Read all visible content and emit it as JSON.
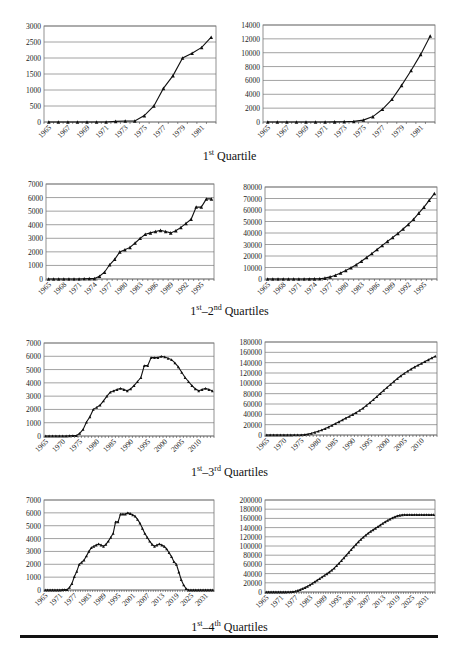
{
  "captions": [
    {
      "sup1": "st",
      "text": "1",
      "sep": "",
      "sup2": "",
      "num2": "",
      "label": " Quartile"
    },
    {
      "sup1": "st",
      "text": "1",
      "sep": "–",
      "num2": "2",
      "sup2": "nd",
      "label": " Quartiles"
    },
    {
      "sup1": "st",
      "text": "1",
      "sep": "–",
      "num2": "3",
      "sup2": "rd",
      "label": " Quartiles"
    },
    {
      "sup1": "st",
      "text": "1",
      "sep": "–",
      "num2": "4",
      "sup2": "th",
      "label": " Quartiles"
    }
  ],
  "chart_data": [
    {
      "id": "q1-annual",
      "type": "line",
      "title": "",
      "xlabel": "",
      "ylabel": "",
      "ylim": [
        0,
        3000
      ],
      "yticks": [
        0,
        500,
        1000,
        1500,
        2000,
        2500,
        3000
      ],
      "x_start": 1965,
      "x_end": 1982,
      "xtick_step": 2,
      "xticks": [
        "1965",
        "1967",
        "1969",
        "1971",
        "1973",
        "1975",
        "1977",
        "1979",
        "1981"
      ],
      "values": [
        0,
        0,
        0,
        0,
        0,
        0,
        0,
        20,
        30,
        30,
        200,
        500,
        1050,
        1450,
        2000,
        2150,
        2330,
        2650
      ],
      "grid": true,
      "marker": "triangle"
    },
    {
      "id": "q1-cumulative",
      "type": "line",
      "title": "",
      "xlabel": "",
      "ylabel": "",
      "ylim": [
        0,
        14000
      ],
      "yticks": [
        0,
        2000,
        4000,
        6000,
        8000,
        10000,
        12000,
        14000
      ],
      "x_start": 1965,
      "x_end": 1982,
      "xtick_step": 2,
      "xticks": [
        "1965",
        "1967",
        "1969",
        "1971",
        "1973",
        "1975",
        "1977",
        "1979",
        "1981"
      ],
      "values": [
        0,
        0,
        0,
        0,
        0,
        0,
        0,
        20,
        50,
        80,
        280,
        780,
        1830,
        3280,
        5280,
        7430,
        9760,
        12410
      ],
      "grid": true,
      "marker": "triangle"
    },
    {
      "id": "q12-annual",
      "type": "line",
      "title": "",
      "xlabel": "",
      "ylabel": "",
      "ylim": [
        0,
        7000
      ],
      "yticks": [
        0,
        1000,
        2000,
        3000,
        4000,
        5000,
        6000,
        7000
      ],
      "x_start": 1965,
      "x_end": 1997,
      "xtick_step": 3,
      "xticks": [
        "1965",
        "1968",
        "1971",
        "1974",
        "1977",
        "1980",
        "1983",
        "1986",
        "1989",
        "1992",
        "1995"
      ],
      "values": [
        0,
        0,
        0,
        0,
        0,
        0,
        0,
        20,
        30,
        30,
        200,
        500,
        1050,
        1450,
        2000,
        2150,
        2330,
        2650,
        3000,
        3300,
        3400,
        3500,
        3580,
        3500,
        3400,
        3550,
        3800,
        4100,
        4400,
        5300,
        5300,
        5900,
        5900
      ],
      "grid": true,
      "marker": "triangle"
    },
    {
      "id": "q12-cumulative",
      "type": "line",
      "title": "",
      "xlabel": "",
      "ylabel": "",
      "ylim": [
        0,
        80000
      ],
      "yticks": [
        0,
        10000,
        20000,
        30000,
        40000,
        50000,
        60000,
        70000,
        80000
      ],
      "x_start": 1965,
      "x_end": 1997,
      "xtick_step": 3,
      "xticks": [
        "1965",
        "1968",
        "1971",
        "1974",
        "1977",
        "1980",
        "1983",
        "1986",
        "1989",
        "1992",
        "1995"
      ],
      "values": "cumulative-of:q12-annual",
      "grid": true,
      "marker": "triangle"
    },
    {
      "id": "q123-annual",
      "type": "line",
      "title": "",
      "xlabel": "",
      "ylabel": "",
      "ylim": [
        0,
        7000
      ],
      "yticks": [
        0,
        1000,
        2000,
        3000,
        4000,
        5000,
        6000,
        7000
      ],
      "x_start": 1965,
      "x_end": 2014,
      "xtick_step": 5,
      "xticks": [
        "1965",
        "1970",
        "1975",
        "1980",
        "1985",
        "1990",
        "1995",
        "2000",
        "2005",
        "2010"
      ],
      "values": [
        0,
        0,
        0,
        0,
        0,
        0,
        0,
        20,
        30,
        30,
        200,
        500,
        1050,
        1450,
        2000,
        2150,
        2330,
        2650,
        3000,
        3300,
        3400,
        3500,
        3580,
        3500,
        3400,
        3550,
        3800,
        4100,
        4400,
        5300,
        5300,
        5900,
        5900,
        5900,
        6000,
        5950,
        5850,
        5750,
        5500,
        5200,
        4800,
        4400,
        4100,
        3800,
        3550,
        3400,
        3500,
        3580,
        3500,
        3400
      ],
      "grid": true,
      "marker": "triangle"
    },
    {
      "id": "q123-cumulative",
      "type": "line",
      "title": "",
      "xlabel": "",
      "ylabel": "",
      "ylim": [
        0,
        180000
      ],
      "yticks": [
        0,
        20000,
        40000,
        60000,
        80000,
        100000,
        120000,
        140000,
        160000,
        180000
      ],
      "x_start": 1965,
      "x_end": 2014,
      "xtick_step": 5,
      "xticks": [
        "1965",
        "1970",
        "1975",
        "1980",
        "1985",
        "1990",
        "1995",
        "2000",
        "2005",
        "2010"
      ],
      "values": "cumulative-of:q123-annual",
      "grid": true,
      "marker": "triangle"
    },
    {
      "id": "q1234-annual",
      "type": "line",
      "title": "",
      "xlabel": "",
      "ylabel": "",
      "ylim": [
        0,
        7000
      ],
      "yticks": [
        0,
        1000,
        2000,
        3000,
        4000,
        5000,
        6000,
        7000
      ],
      "x_start": 1965,
      "x_end": 2034,
      "xtick_step": 6,
      "xticks": [
        "1965",
        "1971",
        "1977",
        "1983",
        "1989",
        "1995",
        "2001",
        "2007",
        "2013",
        "2019",
        "2025",
        "2031"
      ],
      "values": [
        0,
        0,
        0,
        0,
        0,
        0,
        0,
        20,
        30,
        30,
        200,
        500,
        1050,
        1450,
        2000,
        2150,
        2330,
        2650,
        3000,
        3300,
        3400,
        3500,
        3580,
        3500,
        3400,
        3550,
        3800,
        4100,
        4400,
        5300,
        5300,
        5900,
        5900,
        5900,
        6000,
        5950,
        5850,
        5750,
        5500,
        5200,
        4800,
        4400,
        4100,
        3800,
        3550,
        3400,
        3500,
        3580,
        3500,
        3400,
        3200,
        2900,
        2600,
        2200,
        2000,
        1400,
        800,
        400,
        100,
        0,
        0,
        0,
        0,
        0,
        0,
        0,
        0,
        0,
        0,
        0
      ],
      "grid": true,
      "marker": "triangle"
    },
    {
      "id": "q1234-cumulative",
      "type": "line",
      "title": "",
      "xlabel": "",
      "ylabel": "",
      "ylim": [
        0,
        200000
      ],
      "yticks": [
        0,
        20000,
        40000,
        60000,
        80000,
        100000,
        120000,
        140000,
        160000,
        180000,
        200000
      ],
      "x_start": 1965,
      "x_end": 2034,
      "xtick_step": 6,
      "xticks": [
        "1965",
        "1971",
        "1977",
        "1983",
        "1989",
        "1995",
        "2001",
        "2007",
        "2013",
        "2019",
        "2025",
        "2031"
      ],
      "values": "cumulative-of:q1234-annual",
      "grid": true,
      "marker": "triangle"
    }
  ]
}
